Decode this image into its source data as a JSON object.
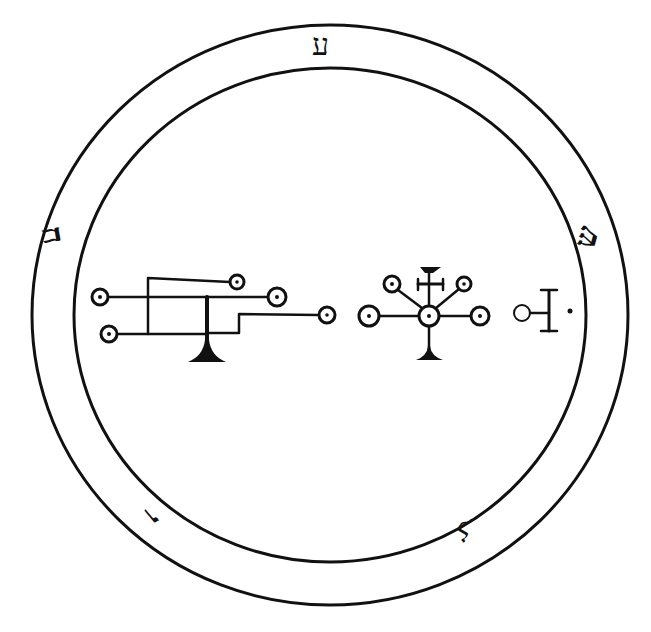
{
  "seal": {
    "colors": {
      "ink": "#111111",
      "paper": "#ffffff"
    },
    "outer_circle": {
      "cx": 330,
      "cy": 315,
      "rx": 298,
      "ry": 290
    },
    "inner_circle": {
      "cx": 330,
      "cy": 315,
      "rx": 256,
      "ry": 247
    },
    "ring_letters": [
      {
        "position": "top",
        "letter": "ע"
      },
      {
        "position": "right",
        "letter": "ש"
      },
      {
        "position": "bottom-right",
        "letter": "ל"
      },
      {
        "position": "bottom-left",
        "letter": "ו"
      },
      {
        "position": "left",
        "letter": "ח"
      }
    ],
    "sigils": [
      {
        "name": "left-sigil",
        "type": "branched-line-figure",
        "nodes": 5
      },
      {
        "name": "center-sigil",
        "type": "radial-cross-figure",
        "nodes": 5
      },
      {
        "name": "right-sigil",
        "type": "circle-with-bar-and-dot",
        "nodes": 1
      }
    ]
  }
}
